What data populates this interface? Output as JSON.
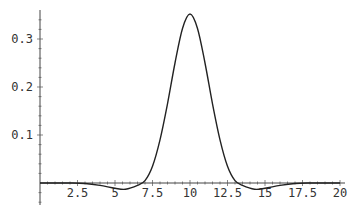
{
  "chart_data": {
    "type": "line",
    "title": "",
    "xlabel": "",
    "ylabel": "",
    "xlim": [
      0,
      20
    ],
    "ylim": [
      -0.03,
      0.36
    ],
    "grid": false,
    "legend": null,
    "x_ticks": [
      "2.5",
      "5",
      "7.5",
      "10",
      "12.5",
      "15",
      "17.5",
      "20"
    ],
    "y_ticks": [
      "0.1",
      "0.2",
      "0.3"
    ],
    "series": [
      {
        "name": "f(x)",
        "x": [
          0,
          1,
          2,
          3,
          4,
          5,
          5.7,
          6.5,
          7,
          7.5,
          8,
          8.5,
          9,
          9.5,
          10,
          10.5,
          11,
          11.5,
          12,
          12.5,
          13,
          13.5,
          14.3,
          15,
          16,
          17,
          18,
          19,
          20
        ],
        "values": [
          0,
          0,
          0,
          -0.001,
          -0.005,
          -0.011,
          -0.013,
          -0.005,
          0.005,
          0.035,
          0.09,
          0.165,
          0.25,
          0.322,
          0.352,
          0.322,
          0.25,
          0.165,
          0.09,
          0.035,
          0.005,
          -0.005,
          -0.013,
          -0.011,
          -0.005,
          -0.001,
          0,
          0,
          0
        ]
      }
    ],
    "color": "#222222"
  }
}
